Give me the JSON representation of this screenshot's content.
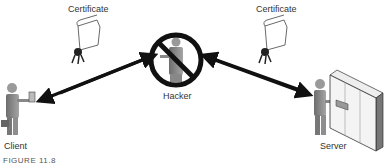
{
  "labels": {
    "cert_left": "Certificate",
    "cert_right": "Certificate",
    "client": "Client",
    "hacker": "Hacker",
    "server": "Server"
  },
  "caption": "FIGURE 11.8",
  "colors": {
    "figure": "#8a8a8a",
    "figure_dark": "#5a5a5a",
    "arrow": "#111111",
    "prohibit": "#111111"
  }
}
